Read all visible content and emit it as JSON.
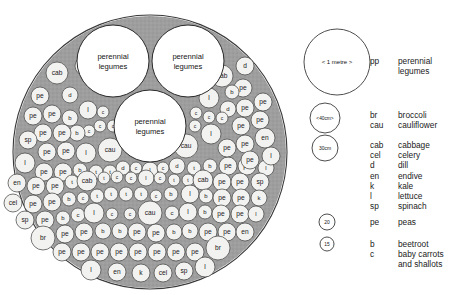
{
  "diagram": {
    "outer_circle": {
      "cx": 150,
      "cy": 152,
      "r": 137
    },
    "bed_fill": "#9e9e9e",
    "plant_fill": "#f2f2f0",
    "stroke": "#3a3a3a",
    "perennial_label": "perennial\nlegumes",
    "perennial_circles": [
      {
        "cx": 113,
        "cy": 61,
        "r": 36
      },
      {
        "cx": 188,
        "cy": 61,
        "r": 36
      },
      {
        "cx": 150,
        "cy": 126,
        "r": 36
      }
    ],
    "plants": [
      {
        "x": 57,
        "y": 73,
        "r": 11,
        "label": "cab"
      },
      {
        "x": 84,
        "y": 66,
        "r": 9,
        "label": ""
      },
      {
        "x": 70,
        "y": 95,
        "r": 8,
        "label": "d"
      },
      {
        "x": 40,
        "y": 96,
        "r": 9,
        "label": "pe"
      },
      {
        "x": 33,
        "y": 116,
        "r": 9,
        "label": "pe"
      },
      {
        "x": 52,
        "y": 114,
        "r": 9,
        "label": "pe"
      },
      {
        "x": 70,
        "y": 118,
        "r": 8,
        "label": "b"
      },
      {
        "x": 88,
        "y": 110,
        "r": 9,
        "label": "l"
      },
      {
        "x": 103,
        "y": 112,
        "r": 6,
        "label": "c"
      },
      {
        "x": 100,
        "y": 126,
        "r": 6,
        "label": "c"
      },
      {
        "x": 113,
        "y": 126,
        "r": 6,
        "label": "c"
      },
      {
        "x": 89,
        "y": 131,
        "r": 6,
        "label": "c"
      },
      {
        "x": 77,
        "y": 133,
        "r": 8,
        "label": "b"
      },
      {
        "x": 43,
        "y": 133,
        "r": 9,
        "label": "pe"
      },
      {
        "x": 62,
        "y": 133,
        "r": 9,
        "label": "pe"
      },
      {
        "x": 28,
        "y": 140,
        "r": 9,
        "label": "sp"
      },
      {
        "x": 47,
        "y": 152,
        "r": 9,
        "label": "pe"
      },
      {
        "x": 66,
        "y": 151,
        "r": 9,
        "label": "pe"
      },
      {
        "x": 86,
        "y": 153,
        "r": 10,
        "label": "l"
      },
      {
        "x": 110,
        "y": 150,
        "r": 12,
        "label": "cau"
      },
      {
        "x": 25,
        "y": 163,
        "r": 10,
        "label": "l"
      },
      {
        "x": 44,
        "y": 172,
        "r": 9,
        "label": "pe"
      },
      {
        "x": 63,
        "y": 172,
        "r": 9,
        "label": "pe"
      },
      {
        "x": 80,
        "y": 170,
        "r": 7,
        "label": "b"
      },
      {
        "x": 96,
        "y": 172,
        "r": 7,
        "label": "t"
      },
      {
        "x": 110,
        "y": 172,
        "r": 7,
        "label": "t"
      },
      {
        "x": 123,
        "y": 168,
        "r": 7,
        "label": "d"
      },
      {
        "x": 136,
        "y": 168,
        "r": 6,
        "label": "c"
      },
      {
        "x": 150,
        "y": 170,
        "r": 8,
        "label": "l"
      },
      {
        "x": 163,
        "y": 168,
        "r": 6,
        "label": "c"
      },
      {
        "x": 177,
        "y": 166,
        "r": 8,
        "label": "d"
      },
      {
        "x": 194,
        "y": 168,
        "r": 7,
        "label": "t"
      },
      {
        "x": 210,
        "y": 166,
        "r": 7,
        "label": "b"
      },
      {
        "x": 228,
        "y": 166,
        "r": 9,
        "label": "pe"
      },
      {
        "x": 247,
        "y": 166,
        "r": 9,
        "label": "pe"
      },
      {
        "x": 266,
        "y": 168,
        "r": 8,
        "label": "l"
      },
      {
        "x": 17,
        "y": 183,
        "r": 9,
        "label": "en"
      },
      {
        "x": 36,
        "y": 186,
        "r": 9,
        "label": "pe"
      },
      {
        "x": 55,
        "y": 186,
        "r": 9,
        "label": "pe"
      },
      {
        "x": 72,
        "y": 182,
        "r": 7,
        "label": "t"
      },
      {
        "x": 87,
        "y": 181,
        "r": 10,
        "label": "cab"
      },
      {
        "x": 104,
        "y": 178,
        "r": 6,
        "label": "t"
      },
      {
        "x": 117,
        "y": 177,
        "r": 6,
        "label": "c"
      },
      {
        "x": 131,
        "y": 178,
        "r": 6,
        "label": "c"
      },
      {
        "x": 146,
        "y": 178,
        "r": 8,
        "label": "l"
      },
      {
        "x": 160,
        "y": 178,
        "r": 6,
        "label": "c"
      },
      {
        "x": 174,
        "y": 180,
        "r": 6,
        "label": "t"
      },
      {
        "x": 188,
        "y": 180,
        "r": 6,
        "label": "t"
      },
      {
        "x": 203,
        "y": 180,
        "r": 10,
        "label": "cab"
      },
      {
        "x": 222,
        "y": 182,
        "r": 9,
        "label": "pe"
      },
      {
        "x": 240,
        "y": 182,
        "r": 9,
        "label": "pe"
      },
      {
        "x": 260,
        "y": 182,
        "r": 9,
        "label": "sp"
      },
      {
        "x": 13,
        "y": 203,
        "r": 9,
        "label": "cel"
      },
      {
        "x": 33,
        "y": 204,
        "r": 9,
        "label": "pe"
      },
      {
        "x": 52,
        "y": 202,
        "r": 9,
        "label": "pe"
      },
      {
        "x": 69,
        "y": 199,
        "r": 7,
        "label": "b"
      },
      {
        "x": 83,
        "y": 198,
        "r": 6,
        "label": "c"
      },
      {
        "x": 97,
        "y": 196,
        "r": 7,
        "label": "t"
      },
      {
        "x": 111,
        "y": 194,
        "r": 7,
        "label": "t"
      },
      {
        "x": 126,
        "y": 194,
        "r": 7,
        "label": "t"
      },
      {
        "x": 141,
        "y": 194,
        "r": 7,
        "label": "t"
      },
      {
        "x": 156,
        "y": 196,
        "r": 6,
        "label": "c"
      },
      {
        "x": 171,
        "y": 194,
        "r": 7,
        "label": "b"
      },
      {
        "x": 190,
        "y": 194,
        "r": 9,
        "label": "l"
      },
      {
        "x": 206,
        "y": 196,
        "r": 7,
        "label": "b"
      },
      {
        "x": 222,
        "y": 198,
        "r": 9,
        "label": "pe"
      },
      {
        "x": 241,
        "y": 198,
        "r": 9,
        "label": "pe"
      },
      {
        "x": 259,
        "y": 198,
        "r": 8,
        "label": "k"
      },
      {
        "x": 25,
        "y": 220,
        "r": 9,
        "label": "sp"
      },
      {
        "x": 45,
        "y": 220,
        "r": 9,
        "label": "pe"
      },
      {
        "x": 63,
        "y": 218,
        "r": 7,
        "label": "b"
      },
      {
        "x": 78,
        "y": 215,
        "r": 7,
        "label": "c"
      },
      {
        "x": 94,
        "y": 213,
        "r": 10,
        "label": "l"
      },
      {
        "x": 112,
        "y": 214,
        "r": 6,
        "label": "c"
      },
      {
        "x": 130,
        "y": 214,
        "r": 6,
        "label": "c"
      },
      {
        "x": 150,
        "y": 213,
        "r": 12,
        "label": "cau"
      },
      {
        "x": 172,
        "y": 213,
        "r": 7,
        "label": "c"
      },
      {
        "x": 188,
        "y": 212,
        "r": 9,
        "label": "l"
      },
      {
        "x": 205,
        "y": 212,
        "r": 7,
        "label": "b"
      },
      {
        "x": 221,
        "y": 214,
        "r": 9,
        "label": "pe"
      },
      {
        "x": 240,
        "y": 214,
        "r": 9,
        "label": "pe"
      },
      {
        "x": 256,
        "y": 214,
        "r": 8,
        "label": "l"
      },
      {
        "x": 43,
        "y": 238,
        "r": 12,
        "label": "br"
      },
      {
        "x": 65,
        "y": 234,
        "r": 9,
        "label": "pe"
      },
      {
        "x": 84,
        "y": 232,
        "r": 9,
        "label": "pe"
      },
      {
        "x": 103,
        "y": 231,
        "r": 8,
        "label": "b"
      },
      {
        "x": 120,
        "y": 231,
        "r": 8,
        "label": "b"
      },
      {
        "x": 137,
        "y": 232,
        "r": 9,
        "label": "pe"
      },
      {
        "x": 156,
        "y": 233,
        "r": 9,
        "label": "pe"
      },
      {
        "x": 174,
        "y": 232,
        "r": 8,
        "label": "b"
      },
      {
        "x": 190,
        "y": 231,
        "r": 8,
        "label": "b"
      },
      {
        "x": 208,
        "y": 232,
        "r": 9,
        "label": "pe"
      },
      {
        "x": 227,
        "y": 232,
        "r": 9,
        "label": "pe"
      },
      {
        "x": 245,
        "y": 232,
        "r": 9,
        "label": "en"
      },
      {
        "x": 62,
        "y": 252,
        "r": 9,
        "label": "pe"
      },
      {
        "x": 81,
        "y": 252,
        "r": 9,
        "label": "pe"
      },
      {
        "x": 100,
        "y": 252,
        "r": 9,
        "label": "pe"
      },
      {
        "x": 119,
        "y": 252,
        "r": 9,
        "label": "pe"
      },
      {
        "x": 138,
        "y": 252,
        "r": 9,
        "label": "pe"
      },
      {
        "x": 157,
        "y": 252,
        "r": 9,
        "label": "pe"
      },
      {
        "x": 176,
        "y": 252,
        "r": 9,
        "label": "pe"
      },
      {
        "x": 195,
        "y": 252,
        "r": 9,
        "label": "pe"
      },
      {
        "x": 218,
        "y": 248,
        "r": 12,
        "label": "br"
      },
      {
        "x": 91,
        "y": 270,
        "r": 10,
        "label": "l"
      },
      {
        "x": 117,
        "y": 272,
        "r": 9,
        "label": "en"
      },
      {
        "x": 141,
        "y": 273,
        "r": 9,
        "label": "k"
      },
      {
        "x": 163,
        "y": 273,
        "r": 9,
        "label": "cel"
      },
      {
        "x": 184,
        "y": 271,
        "r": 9,
        "label": "sp"
      },
      {
        "x": 205,
        "y": 267,
        "r": 10,
        "label": "l"
      },
      {
        "x": 222,
        "y": 76,
        "r": 11,
        "label": "cab"
      },
      {
        "x": 245,
        "y": 66,
        "r": 9,
        "label": "d"
      },
      {
        "x": 243,
        "y": 88,
        "r": 9,
        "label": "pe"
      },
      {
        "x": 232,
        "y": 92,
        "r": 7,
        "label": "b"
      },
      {
        "x": 209,
        "y": 98,
        "r": 10,
        "label": "l"
      },
      {
        "x": 263,
        "y": 102,
        "r": 9,
        "label": "pe"
      },
      {
        "x": 245,
        "y": 108,
        "r": 9,
        "label": "pe"
      },
      {
        "x": 228,
        "y": 109,
        "r": 8,
        "label": "d"
      },
      {
        "x": 196,
        "y": 113,
        "r": 6,
        "label": "c"
      },
      {
        "x": 209,
        "y": 117,
        "r": 6,
        "label": "c"
      },
      {
        "x": 222,
        "y": 118,
        "r": 6,
        "label": "c"
      },
      {
        "x": 195,
        "y": 126,
        "r": 6,
        "label": "c"
      },
      {
        "x": 260,
        "y": 120,
        "r": 9,
        "label": "pe"
      },
      {
        "x": 241,
        "y": 126,
        "r": 9,
        "label": "pe"
      },
      {
        "x": 211,
        "y": 134,
        "r": 10,
        "label": "l"
      },
      {
        "x": 265,
        "y": 138,
        "r": 10,
        "label": "en"
      },
      {
        "x": 245,
        "y": 144,
        "r": 9,
        "label": "pe"
      },
      {
        "x": 227,
        "y": 148,
        "r": 9,
        "label": "pe"
      },
      {
        "x": 186,
        "y": 146,
        "r": 12,
        "label": "cau"
      },
      {
        "x": 271,
        "y": 156,
        "r": 9,
        "label": "l"
      },
      {
        "x": 250,
        "y": 160,
        "r": 9,
        "label": "pe"
      }
    ]
  },
  "scale_key": {
    "metre_circle": {
      "cx": 337,
      "cy": 62,
      "r": 33,
      "label": "< 1 metre >"
    },
    "forty_circle": {
      "cx": 325,
      "cy": 118,
      "r": 15,
      "label": "<40cm>"
    },
    "thirty_circle": {
      "cx": 325,
      "cy": 148,
      "r": 13,
      "label": "30cm"
    },
    "twenty_circle": {
      "cx": 327,
      "cy": 222,
      "r": 8,
      "label": "20"
    },
    "fifteen_circle": {
      "cx": 327,
      "cy": 244,
      "r": 7,
      "label": "15"
    }
  },
  "legend": {
    "groups": [
      {
        "top": 56,
        "rows": [
          {
            "abbr": "pp",
            "name": "perennial"
          },
          {
            "abbr": "",
            "name": "legumes"
          }
        ]
      },
      {
        "top": 110,
        "rows": [
          {
            "abbr": "br",
            "name": "broccoli"
          },
          {
            "abbr": "cau",
            "name": "cauliflower"
          }
        ]
      },
      {
        "top": 140,
        "rows": [
          {
            "abbr": "cab",
            "name": "cabbage"
          },
          {
            "abbr": "cel",
            "name": "celery"
          },
          {
            "abbr": "d",
            "name": "dill"
          },
          {
            "abbr": "en",
            "name": "endive"
          },
          {
            "abbr": "k",
            "name": "kale"
          },
          {
            "abbr": "l",
            "name": "lettuce"
          },
          {
            "abbr": "sp",
            "name": "spinach"
          }
        ]
      },
      {
        "top": 217,
        "rows": [
          {
            "abbr": "pe",
            "name": "peas"
          }
        ]
      },
      {
        "top": 239,
        "rows": [
          {
            "abbr": "b",
            "name": "beetroot"
          },
          {
            "abbr": "c",
            "name": "baby carrots"
          },
          {
            "abbr": "",
            "name": "and shallots"
          }
        ]
      }
    ]
  }
}
